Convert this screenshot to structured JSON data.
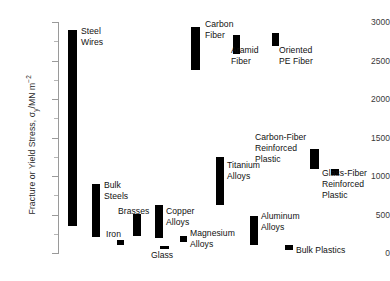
{
  "chart_data": {
    "type": "bar",
    "orientation": "vertical-range",
    "title": "",
    "xlabel": "",
    "ylabel": "Fracture or Yield Stress, σy/MN m⁻²",
    "ylabel_parts": {
      "prefix": "Fracture or Yield Stress, ",
      "symbol": "σ",
      "subscript": "y",
      "units": "/MN m",
      "superscript": "−2"
    },
    "ylim": [
      0,
      3000
    ],
    "y_ticks": [
      0,
      500,
      1000,
      1500,
      2000,
      2500,
      3000
    ],
    "y_tick_labels": [
      "0",
      "500",
      "1000",
      "1500",
      "2000",
      "2500",
      "3000"
    ],
    "y_minor_ticks": [
      250,
      750,
      1250,
      1750,
      2250,
      2750
    ],
    "grid": false,
    "legend": "none",
    "categories": [
      "Steel Wires",
      "Bulk Steels",
      "Iron",
      "Brasses",
      "Copper Alloys",
      "Glass",
      "Magnesium Alloys",
      "Carbon Fiber",
      "Aramid Fiber",
      "Oriented PE Fiber",
      "Titanium Alloys",
      "Aluminum Alloys",
      "Carbon-Fiber Reinforced Plastic",
      "Glass-Fiber Reinforced Plastic",
      "Bulk Plastics"
    ],
    "series": [
      {
        "name": "Fracture or Yield Stress range",
        "bars": [
          {
            "category": "Steel Wires",
            "low": 350,
            "high": 2890,
            "x_px": 68,
            "w_px": 9
          },
          {
            "category": "Bulk Steels",
            "low": 205,
            "high": 900,
            "x_px": 92,
            "w_px": 8
          },
          {
            "category": "Iron",
            "low": 105,
            "high": 175,
            "x_px": 117,
            "w_px": 7
          },
          {
            "category": "Brasses",
            "low": 215,
            "high": 510,
            "x_px": 133,
            "w_px": 8
          },
          {
            "category": "Copper Alloys",
            "low": 200,
            "high": 620,
            "x_px": 155,
            "w_px": 8
          },
          {
            "category": "Glass",
            "low": 55,
            "high": 90,
            "x_px": 160,
            "w_px": 9
          },
          {
            "category": "Magnesium Alloys",
            "low": 140,
            "high": 220,
            "x_px": 180,
            "w_px": 7
          },
          {
            "category": "Carbon Fiber",
            "low": 2370,
            "high": 2930,
            "x_px": 191,
            "w_px": 9
          },
          {
            "category": "Aramid Fiber",
            "low": 2580,
            "high": 2830,
            "x_px": 233,
            "w_px": 7
          },
          {
            "category": "Oriented PE Fiber",
            "low": 2690,
            "high": 2860,
            "x_px": 272,
            "w_px": 7
          },
          {
            "category": "Titanium Alloys",
            "low": 620,
            "high": 1250,
            "x_px": 216,
            "w_px": 8
          },
          {
            "category": "Aluminum Alloys",
            "low": 105,
            "high": 480,
            "x_px": 250,
            "w_px": 8
          },
          {
            "category": "Carbon-Fiber Reinforced Plastic",
            "low": 1090,
            "high": 1350,
            "x_px": 310,
            "w_px": 9
          },
          {
            "category": "Glass-Fiber Reinforced Plastic",
            "low": 1015,
            "high": 1085,
            "x_px": 331,
            "w_px": 8
          },
          {
            "category": "Bulk Plastics",
            "low": 45,
            "high": 105,
            "x_px": 285,
            "w_px": 8
          }
        ]
      }
    ],
    "annotations": [
      {
        "text": "Steel\nWires",
        "x_px": 81,
        "y_px": 26,
        "align": "left"
      },
      {
        "text": "Carbon\nFiber",
        "x_px": 205,
        "y_px": 19,
        "align": "left"
      },
      {
        "text": "Aramid\nFiber",
        "x_px": 231,
        "y_px": 45,
        "align": "left"
      },
      {
        "text": "Oriented\nPE Fiber",
        "x_px": 279,
        "y_px": 45,
        "align": "left"
      },
      {
        "text": "Carbon-Fiber\nReinforced\nPlastic",
        "x_px": 255,
        "y_px": 132,
        "align": "left"
      },
      {
        "text": "Glass-Fiber\nReinforced\nPlastic",
        "x_px": 322,
        "y_px": 168,
        "align": "left"
      },
      {
        "text": "Titanium\nAlloys",
        "x_px": 227,
        "y_px": 160,
        "align": "left"
      },
      {
        "text": "Bulk\nSteels",
        "x_px": 104,
        "y_px": 180,
        "align": "left"
      },
      {
        "text": "Brasses",
        "x_px": 118,
        "y_px": 206,
        "align": "left"
      },
      {
        "text": "Copper\nAlloys",
        "x_px": 166,
        "y_px": 206,
        "align": "left"
      },
      {
        "text": "Iron",
        "x_px": 106,
        "y_px": 229,
        "align": "left"
      },
      {
        "text": "Aluminum\nAlloys",
        "x_px": 261,
        "y_px": 211,
        "align": "left"
      },
      {
        "text": "Magnesium\nAlloys",
        "x_px": 190,
        "y_px": 228,
        "align": "left"
      },
      {
        "text": "Glass",
        "x_px": 151,
        "y_px": 250,
        "align": "left"
      },
      {
        "text": "Bulk Plastics",
        "x_px": 296,
        "y_px": 245,
        "align": "left"
      }
    ],
    "colors": {
      "bar": "#000000",
      "axis": "#9a9a9a",
      "text": "#111111",
      "background": "#ffffff"
    },
    "geometry": {
      "plot_left_px": 58,
      "y_zero_px": 253,
      "y_top_px": 22,
      "y_top_value": 3000
    }
  }
}
